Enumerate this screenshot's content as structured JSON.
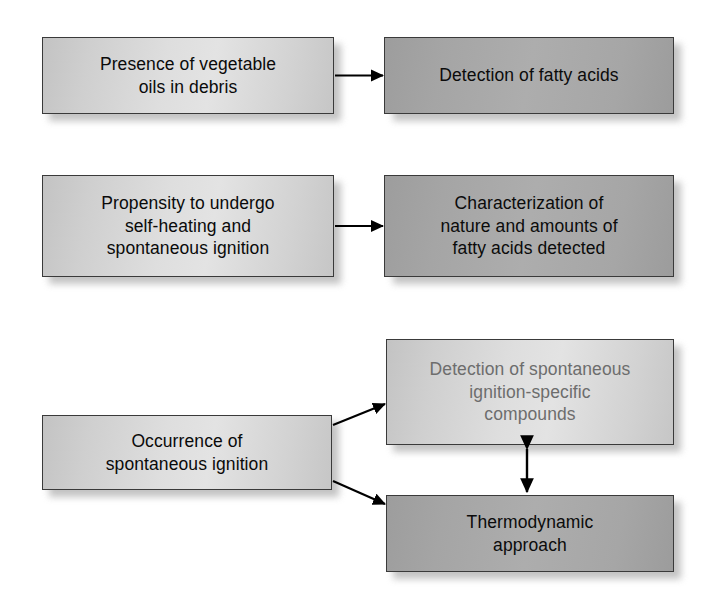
{
  "diagram": {
    "background_color": "#ffffff",
    "box_fill_light": "#dcdcdc",
    "box_fill_dark": "#a8a8a8",
    "box_border_color": "#3a3a3a",
    "text_color": "#0a0a0a",
    "faint_text_color": "#6d6d6d",
    "arrow_color": "#000000",
    "rows": [
      {
        "id": "row-1",
        "source": {
          "id": "presence-of-vegetable-oils",
          "text": "Presence of vegetable\noils in debris",
          "style": "light"
        },
        "targets": [
          {
            "id": "detection-of-fatty-acids",
            "text": "Detection of fatty acids",
            "style": "dark"
          }
        ],
        "connector": "single-arrow"
      },
      {
        "id": "row-2",
        "source": {
          "id": "propensity-to-undergo-self-heating",
          "text": "Propensity to undergo\nself-heating and\nspontaneous ignition",
          "style": "light"
        },
        "targets": [
          {
            "id": "characterization-of-fatty-acids",
            "text": "Characterization of\nnature and amounts of\nfatty acids detected",
            "style": "dark"
          }
        ],
        "connector": "single-arrow"
      },
      {
        "id": "row-3",
        "source": {
          "id": "occurrence-of-spontaneous-ignition",
          "text": "Occurrence of\nspontaneous ignition",
          "style": "light"
        },
        "targets": [
          {
            "id": "detection-of-ignition-specific-compounds",
            "text": "Detection of spontaneous\nignition-specific\ncompounds",
            "style": "light-faint"
          },
          {
            "id": "thermodynamic-approach",
            "text": "Thermodynamic\napproach",
            "style": "dark"
          }
        ],
        "connector": "branching-arrows",
        "cross_link": "double-headed-vertical-arrow"
      }
    ]
  }
}
